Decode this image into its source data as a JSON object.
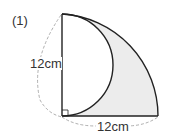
{
  "problem": {
    "number": "(1)",
    "vertical_label": "12cm",
    "horizontal_label": "12cm",
    "shade_color": "#ececec",
    "line_color": "#222222",
    "dash_color": "#999999"
  }
}
